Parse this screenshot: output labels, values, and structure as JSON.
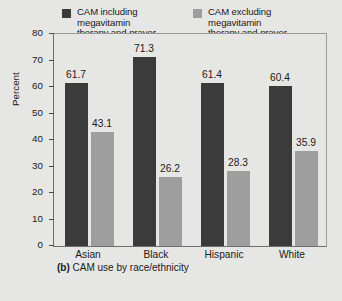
{
  "chart_data": {
    "type": "bar",
    "title": "",
    "caption_tag": "(b)",
    "caption_text": "CAM use by race/ethnicity",
    "xlabel": "",
    "ylabel": "Percent",
    "ylim": [
      0,
      80
    ],
    "yticks": [
      0,
      10,
      20,
      30,
      40,
      50,
      60,
      70,
      80
    ],
    "ytick_labels": [
      "0",
      "10",
      "20",
      "30",
      "40",
      "50",
      "60",
      "70",
      "80"
    ],
    "grid": false,
    "legend_position": "top",
    "categories": [
      "Asian",
      "Black",
      "Hispanic",
      "White"
    ],
    "series": [
      {
        "name": "CAM including\nmegavitamin\ntherapy and prayer",
        "color": "#3b3b3b",
        "values": [
          61.7,
          71.3,
          61.4,
          60.4
        ],
        "labels": [
          "61.7",
          "71.3",
          "61.4",
          "60.4"
        ]
      },
      {
        "name": "CAM excluding\nmegavitamin\ntherapy and prayer",
        "color": "#9e9e9e",
        "values": [
          43.1,
          26.2,
          28.3,
          35.9
        ],
        "labels": [
          "43.1",
          "26.2",
          "28.3",
          "35.9"
        ]
      }
    ]
  },
  "figure": {
    "background_color": "#e6e6e4",
    "axis_color": "#6e6e6e"
  }
}
